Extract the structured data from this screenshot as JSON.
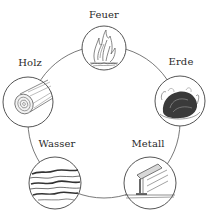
{
  "diagram": {
    "title": "",
    "type": "cycle",
    "elements": [
      {
        "id": "feuer",
        "label": "Feuer",
        "icon": "fire-icon"
      },
      {
        "id": "erde",
        "label": "Erde",
        "icon": "earth-mound-icon"
      },
      {
        "id": "metall",
        "label": "Metall",
        "icon": "metal-rail-icon"
      },
      {
        "id": "wasser",
        "label": "Wasser",
        "icon": "water-waves-icon"
      },
      {
        "id": "holz",
        "label": "Holz",
        "icon": "wood-log-icon"
      }
    ],
    "cycle_order": [
      "Feuer",
      "Erde",
      "Metall",
      "Wasser",
      "Holz"
    ],
    "colors": {
      "stroke": "#6a6a6a",
      "text": "#2a2a2a",
      "background": "#ffffff"
    }
  }
}
